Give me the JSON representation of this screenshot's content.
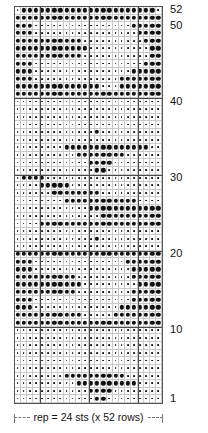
{
  "chart_data": {
    "type": "heatmap",
    "title": "",
    "xlabel": "",
    "ylabel": "",
    "columns": 24,
    "rows": 52,
    "legend": [],
    "grid": true,
    "axis_ranges": {
      "x": [
        1,
        24
      ],
      "y": [
        1,
        52
      ]
    },
    "row_labels": [
      {
        "row": 52,
        "text": "52"
      },
      {
        "row": 50,
        "text": "50"
      },
      {
        "row": 40,
        "text": "40"
      },
      {
        "row": 30,
        "text": "30"
      },
      {
        "row": 20,
        "text": "20"
      },
      {
        "row": 10,
        "text": "10"
      },
      {
        "row": 1,
        "text": "1"
      }
    ],
    "heavy_columns": [
      4,
      12,
      20
    ],
    "heavy_rows": [
      10,
      20,
      30,
      40
    ],
    "cell_symbols": {
      "filled": "large-dot",
      "empty": "small-dot"
    },
    "values": [
      "011111111111111111111110",
      "111111111111111111111111",
      "111000000000000000011111",
      "111000000000000000001111",
      "111111111110000000000111",
      "111111111111000000000011",
      "111111111110000000000011",
      "111000000000000000000111",
      "111000000000000000011111",
      "111000000000000001111111",
      "111111111111110001111111",
      "111111111111111111111111",
      "000000000000000000000000",
      "000000000000000000000000",
      "000000000000000000000000",
      "000000000000000000000000",
      "000000000000010000000000",
      "000000000000000000000000",
      "000000001111111111111100",
      "000000000011111111000000",
      "000000000000111100000000",
      "000000000000011000000000",
      "011110000000000000000000",
      "000011111000000000000000",
      "000000111111110000000000",
      "000000001111111111110000",
      "000000000000111111111111",
      "000000000000001111111111",
      "000011111111111111111111",
      "000000000000000000000000",
      "000000000000010000000000",
      "000000000000000000000000",
      "111111111111111111111111",
      "111000000000000000111111",
      "111000000000000000011111",
      "111111111100000000011111",
      "111111111110000000001111",
      "111111111100000000011111",
      "111000000000000000011111",
      "111000000000000001111111",
      "111111111110000011111111",
      "111111111111111111111111",
      "000000000000000000000000",
      "000000000000000000000000",
      "000000000000000000000000",
      "000000000000000000000000",
      "000000000000000000000000",
      "000000000000000000000000",
      "000000001111111111000000",
      "000000000011111111110000",
      "000000000000111100000000",
      "000000000000011000000000",
      "011110000000000000000000",
      "000011111111111111111100",
      "000000111111111111111111",
      "000000000011111111000000",
      "000000000000110000000000",
      "000000000111111111100000",
      "000000011111111111110000",
      "000000000000000000000000"
    ]
  },
  "caption": {
    "text": "rep = 24 sts (x 52 rows)"
  }
}
